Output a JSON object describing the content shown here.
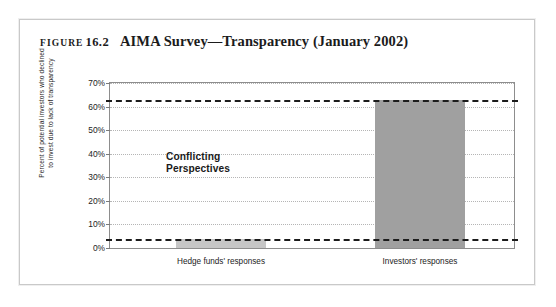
{
  "figure": {
    "label_word": "FIGURE",
    "number": "16.2",
    "title": "AIMA Survey—Transparency (January 2002)"
  },
  "annotation": {
    "line1": "Conflicting",
    "line2": "Perspectives"
  },
  "colors": {
    "bar_investors": "#a0a0a0",
    "bar_hedge_funds": "#c6c6c6",
    "reference_line": "#1c1c1c",
    "gridline": "#b5b5b5",
    "axis": "#8d8d8d"
  },
  "chart_data": {
    "type": "bar",
    "title": "AIMA Survey—Transparency (January 2002)",
    "xlabel": "",
    "ylabel": "Percent of potential investors who declined to invest due to lack of transparency",
    "ylabel_line1": "Percent of potential investors who declined",
    "ylabel_line2": "to invest due to lack of transparency",
    "categories": [
      "Hedge funds' responses",
      "Investors' responses"
    ],
    "values": [
      4,
      63
    ],
    "ylim": [
      0,
      70
    ],
    "ytick_values": [
      0,
      10,
      20,
      30,
      40,
      50,
      60,
      70
    ],
    "ytick_labels": [
      "0%",
      "10%",
      "20%",
      "30%",
      "40%",
      "50%",
      "60%",
      "70%"
    ],
    "grid": true,
    "legend": "none",
    "reference_lines": [
      {
        "name": "investors-level",
        "value": 63
      },
      {
        "name": "hedge-funds-level",
        "value": 4
      }
    ],
    "annotations": [
      {
        "text": "Conflicting Perspectives",
        "x_category": "Hedge funds' responses",
        "y": 33
      }
    ]
  }
}
